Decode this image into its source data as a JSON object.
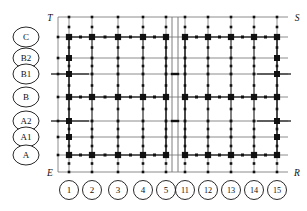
{
  "diagram": {
    "corner_labels": {
      "top_left": "T",
      "top_right": "S",
      "bottom_left": "E",
      "bottom_right": "R"
    },
    "row_labels": [
      "C",
      "B2",
      "B1",
      "B",
      "A2",
      "A1",
      "A"
    ],
    "column_labels_left": [
      "1",
      "2",
      "3",
      "4",
      "5"
    ],
    "column_labels_right": [
      "11",
      "12",
      "13",
      "14",
      "15"
    ],
    "colors": {
      "line": "#6f6f6f",
      "heavy_line": "#3a3a3a",
      "column": "#111111",
      "node": "#111111",
      "text": "#111111",
      "background": "#ffffff"
    },
    "geometry": {
      "frame_left": 58,
      "frame_right": 288,
      "frame_top": 17,
      "frame_bottom": 172,
      "joint_x_left": 172,
      "joint_x_right": 178,
      "row_y": {
        "C": 37,
        "B2": 58,
        "B1": 74,
        "B": 97,
        "A2": 121,
        "A1": 137,
        "A": 155
      },
      "col_x_left": [
        69,
        92,
        118,
        143,
        166
      ],
      "col_x_right": [
        185,
        208,
        231,
        254,
        277
      ],
      "row_circle_x": 26,
      "col_circle_y": 190,
      "circle_rx": 13,
      "circle_ry": 10
    },
    "legend": {
      "column_marker": "filled-square",
      "node_marker": "small-dot",
      "joint_marker": "expansion-joint-double-line"
    },
    "major_rows": [
      "C",
      "B",
      "A"
    ],
    "minor_rows": [
      "B2",
      "B1",
      "A2",
      "A1"
    ]
  }
}
